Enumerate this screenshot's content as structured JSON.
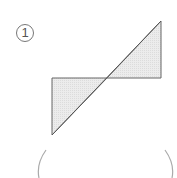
{
  "problem": {
    "number": "1",
    "answer_value": ""
  },
  "figure": {
    "fill_color": "#e8e8e8",
    "stroke_color": "#666666",
    "triangles": [
      {
        "name": "upper-right",
        "points": "161,21 161,78 107,78"
      },
      {
        "name": "lower-left",
        "points": "52,78 107,78 52,135"
      }
    ],
    "diagonal": {
      "x1": 52,
      "y1": 135,
      "x2": 161,
      "y2": 21
    }
  },
  "answer_brackets": {
    "color": "#aaaaaa"
  }
}
